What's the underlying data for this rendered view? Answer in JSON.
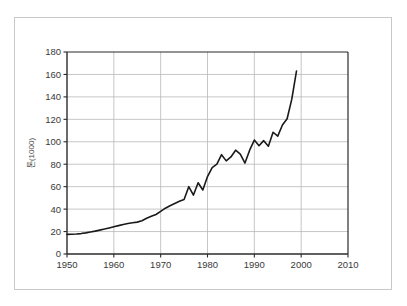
{
  "figure": {
    "width": 407,
    "height": 306,
    "background_color": "#ffffff",
    "border_color": "#c9c9c9",
    "plot_area": {
      "left": 67,
      "top": 52,
      "right": 348,
      "bottom": 254
    }
  },
  "style": {
    "gridline_color": "#b8b8b8",
    "axis_color": "#2b2b2b",
    "series_color": "#1a1a1a",
    "tick_label_color": "#3a3a3a",
    "axis_label_color": "#4a4a4a"
  },
  "chart_data": {
    "type": "line",
    "title": "",
    "subtitle": "",
    "xlabel": "",
    "ylabel": "톤(1000)",
    "ylabel_rotation": -90,
    "xlim": [
      1950,
      2010
    ],
    "ylim": [
      0,
      180
    ],
    "xticks": [
      1950,
      1960,
      1970,
      1980,
      1990,
      2000,
      2010
    ],
    "xticklabels": [
      "1950",
      "1960",
      "1970",
      "1980",
      "1990",
      "2000",
      "2010"
    ],
    "yticks": [
      0,
      20,
      40,
      60,
      80,
      100,
      120,
      140,
      160,
      180
    ],
    "yticklabels": [
      "0",
      "20",
      "40",
      "60",
      "80",
      "100",
      "120",
      "140",
      "160",
      "180"
    ],
    "grid": true,
    "grid_axis": "both",
    "legend": false,
    "legend_position": "none",
    "annotations": [],
    "series": [
      {
        "name": "series-1",
        "color": "#1a1a1a",
        "line_width": 1.6,
        "markers": false,
        "x": [
          1950,
          1951,
          1952,
          1953,
          1954,
          1955,
          1956,
          1957,
          1958,
          1959,
          1960,
          1961,
          1962,
          1963,
          1964,
          1965,
          1966,
          1967,
          1968,
          1969,
          1970,
          1971,
          1972,
          1973,
          1974,
          1975,
          1976,
          1977,
          1978,
          1979,
          1980,
          1981,
          1982,
          1983,
          1984,
          1985,
          1986,
          1987,
          1988,
          1989,
          1990,
          1991,
          1992,
          1993,
          1994,
          1995,
          1996,
          1997,
          1998,
          1999
        ],
        "values": [
          17.5,
          17.6,
          17.8,
          18.2,
          18.8,
          19.6,
          20.4,
          21.3,
          22.2,
          23.2,
          24.3,
          25.3,
          26.3,
          27.2,
          27.8,
          28.4,
          29.6,
          31.8,
          33.6,
          35.2,
          38.0,
          40.8,
          43.0,
          45.0,
          47.0,
          48.5,
          60.0,
          52.5,
          63.5,
          57.0,
          69.0,
          77.0,
          80.0,
          88.5,
          83.0,
          86.5,
          92.5,
          89.0,
          81.0,
          92.5,
          101.5,
          96.5,
          101.0,
          96.0,
          108.5,
          105.0,
          115.0,
          120.5,
          138.0,
          163.0
        ]
      }
    ]
  }
}
